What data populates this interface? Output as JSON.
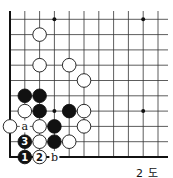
{
  "diagram": {
    "caption": "2 도",
    "grid": {
      "origin_x": 10,
      "origin_y": 157,
      "col_spacing": 14.8,
      "row_spacing": 15.3,
      "cols": 11,
      "rows": 10,
      "right_extent": 168,
      "top_extent": 11,
      "line_color": "#333333",
      "edge_color": "#111111"
    },
    "hoshi": [
      {
        "col": 3,
        "row": 9
      },
      {
        "col": 9,
        "row": 9
      },
      {
        "col": 9,
        "row": 3
      },
      {
        "col": 3,
        "row": 3
      }
    ],
    "stones": [
      {
        "color": "white",
        "col": 2,
        "row": 8
      },
      {
        "color": "white",
        "col": 2,
        "row": 6
      },
      {
        "color": "white",
        "col": 4,
        "row": 6
      },
      {
        "color": "white",
        "col": 5,
        "row": 5
      },
      {
        "color": "black",
        "col": 1,
        "row": 4
      },
      {
        "color": "black",
        "col": 2,
        "row": 4
      },
      {
        "color": "white",
        "col": 1,
        "row": 3
      },
      {
        "color": "black",
        "col": 2,
        "row": 3
      },
      {
        "color": "black",
        "col": 4,
        "row": 3
      },
      {
        "color": "white",
        "col": 5,
        "row": 3
      },
      {
        "color": "white",
        "col": 0,
        "row": 2
      },
      {
        "color": "white",
        "col": 2,
        "row": 2
      },
      {
        "color": "black",
        "col": 3,
        "row": 2
      },
      {
        "color": "white",
        "col": 5,
        "row": 2
      },
      {
        "color": "black",
        "col": 1,
        "row": 1,
        "label": "3"
      },
      {
        "color": "white",
        "col": 2,
        "row": 1
      },
      {
        "color": "black",
        "col": 3,
        "row": 1
      },
      {
        "color": "white",
        "col": 4,
        "row": 1
      },
      {
        "color": "black",
        "col": 1,
        "row": 0,
        "label": "1"
      },
      {
        "color": "white",
        "col": 2,
        "row": 0,
        "label": "2"
      }
    ],
    "letters": [
      {
        "text": "a",
        "col": 1,
        "row": 2
      },
      {
        "text": "b",
        "col": 3,
        "row": 0
      }
    ]
  }
}
